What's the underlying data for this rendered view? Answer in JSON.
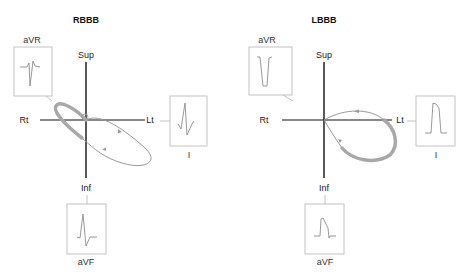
{
  "figure": {
    "panels": [
      {
        "id": "rbbb",
        "title": "RBBB",
        "axes": {
          "superior": "Sup",
          "inferior": "Inf",
          "right": "Rt",
          "left": "Lt"
        },
        "leads": [
          {
            "name": "aVR",
            "label": "aVR",
            "morphology": "rsR' (terminal positive)"
          },
          {
            "name": "I",
            "label": "I",
            "morphology": "qRS with wide S"
          },
          {
            "name": "aVF",
            "label": "aVF",
            "morphology": "RS"
          }
        ],
        "loop": {
          "direction": "counterclockwise",
          "terminal_delay": "rightward-superior"
        }
      },
      {
        "id": "lbbb",
        "title": "LBBB",
        "axes": {
          "superior": "Sup",
          "inferior": "Inf",
          "right": "Rt",
          "left": "Lt"
        },
        "leads": [
          {
            "name": "aVR",
            "label": "aVR",
            "morphology": "QS"
          },
          {
            "name": "I",
            "label": "I",
            "morphology": "broad monophasic R"
          },
          {
            "name": "aVF",
            "label": "aVF",
            "morphology": "broad notched R"
          }
        ],
        "loop": {
          "direction": "clockwise",
          "terminal_delay": "leftward-inferior"
        }
      }
    ],
    "colors": {
      "axis": "#111111",
      "loop": "#9a9a9a",
      "loop_thick": "#a8a8a8",
      "box": "#b5b5b5",
      "trace": "#8c8c8c"
    }
  }
}
